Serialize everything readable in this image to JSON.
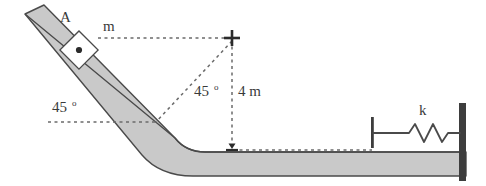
{
  "figure": {
    "colors": {
      "track_fill": "#c9c9c9",
      "track_outline": "#4a4a4a",
      "wall": "#3d3d3d",
      "dotted_line": "#6b6b6b",
      "label_text": "#3a3a3a",
      "background": "#ffffff"
    },
    "labels": {
      "block_name": "A",
      "block_mass": "m",
      "incline_angle": "45",
      "incline_angle_unit": "o",
      "apex_angle": "45",
      "apex_angle_unit": "o",
      "height": "4 m",
      "spring_constant": "k"
    },
    "geometry": {
      "incline_angle_degrees": 45,
      "height_meters": 4,
      "height_units": "m"
    },
    "elements": {
      "incline_ramp": "inclined-track-45-degrees",
      "horizontal_ground": "horizontal-track",
      "block": "block-A-mass-m",
      "spring": "coil-spring-k",
      "right_wall": "fixed-wall",
      "spring_plate": "spring-end-plate",
      "apex_marker": "cross-marker",
      "height_marker": "arrow-marker"
    }
  }
}
